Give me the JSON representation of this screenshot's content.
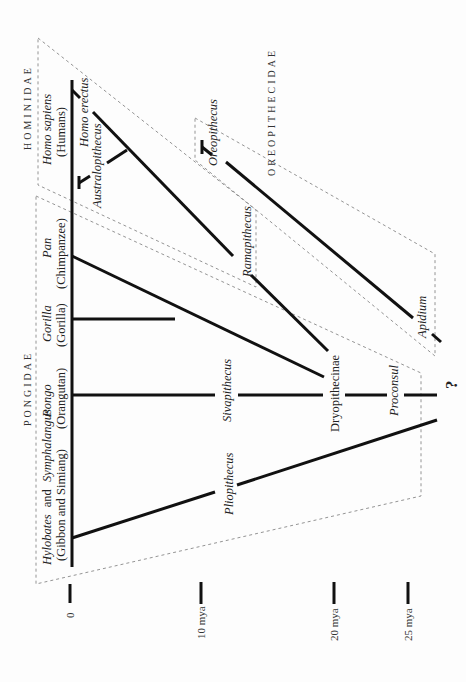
{
  "diagram": {
    "orientation": "rotated 90 degrees counter-clockwise; time axis runs left-to-right",
    "families": {
      "hominidae": "HOMINIDAE",
      "pongidae": "PONGIDAE",
      "oreopithecidae": "OREOPITHECIDAE"
    },
    "taxa": {
      "homo_sapiens": {
        "genus": "Homo sapiens",
        "common": "(Humans)"
      },
      "homo_erectus": "Homo erectus",
      "australopithecus": "Australopithecus",
      "pan": {
        "genus": "Pan",
        "common": "(Chimpanzee)"
      },
      "gorilla": {
        "genus": "Gorilla",
        "common": "(Gorilla)"
      },
      "pongo": {
        "genus": "Pongo",
        "common": "(Orangutan)"
      },
      "hylobates": {
        "genus_a": "Hylobates",
        "and": "and",
        "genus_b": "Symphalangus",
        "common": "(Gibbon and Simiang)"
      },
      "ramapithecus": "Ramapithecus",
      "oreopithecus": "Oreopithecus",
      "apidium": "Apidium",
      "sivapithecus": "Sivapithecus",
      "pliopithecus": "Pliopithecus",
      "dryopithecinae": "Dryopithecinae",
      "proconsul": "Proconsul",
      "unknown_origin": "?"
    },
    "time_axis": {
      "ticks": [
        {
          "label": "0",
          "x": 70
        },
        {
          "label": "10 mya",
          "x": 201
        },
        {
          "label": "20 mya",
          "x": 334
        },
        {
          "label": "25 mya",
          "x": 408
        }
      ]
    }
  }
}
